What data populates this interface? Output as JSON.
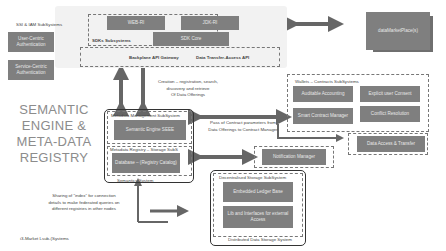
{
  "title": {
    "lines": [
      "SEMANTIC",
      "ENGINE &",
      "META-DATA",
      "REGISTRY"
    ]
  },
  "ssi_iam": {
    "label": "SSI & IAM SubSystems",
    "items": [
      "User-Centric Authentication",
      "Service-Centric Authentication"
    ]
  },
  "sdks": {
    "label": "SDKs Subsystems",
    "items": [
      "WEB-RI",
      "JDK-RI",
      "SDK Core"
    ]
  },
  "api_bar": {
    "items": [
      "Backplane API Gateway",
      "Data Transfer-Access API"
    ]
  },
  "marketplace": {
    "label": "dataMarketPlace(s)"
  },
  "notes": {
    "creation": [
      "Creation – registration, search,",
      "discovery and retrieve",
      "Of Data Offerings"
    ],
    "contract": [
      "Pass of Contract parameters from",
      "Data Offerings to Contract Manager"
    ],
    "sharing": [
      "Sharing of “index” for connection",
      "details to make federated queries on",
      "different registries in other nodes"
    ]
  },
  "semantics": {
    "label": "Semantics System",
    "metadata_mgmt": {
      "label": "Metadata Management SubSystem",
      "items": [
        "Semantic Engine SEEE"
      ]
    },
    "metadata_registry": {
      "label": "Metadata Registry – Storage SubS",
      "items": [
        "Database – (Registry Catalog)"
      ]
    }
  },
  "wallets": {
    "label": "Wallets – Contracts SubSystems",
    "items": [
      "Auditable Accounting",
      "Explicit user Consent",
      "Smart Contract Manager",
      "Conflict Resolution"
    ]
  },
  "notification": {
    "label": "Notification Manager"
  },
  "data_access": {
    "label": "Data Access & Transfer"
  },
  "storage": {
    "label": "Decentralised Storage SubSystem",
    "footer": "Distributed Data Storage System",
    "items": [
      "Embedded Ledger Base",
      "Lib and Interfaces for external Access"
    ]
  },
  "footer": {
    "label": "i3-Market Lsub-(Systems"
  },
  "colors": {
    "box": "#7f7f7f",
    "arrow": "#666666",
    "panel": "#f2f2f2",
    "title": "#8c8c8c"
  }
}
